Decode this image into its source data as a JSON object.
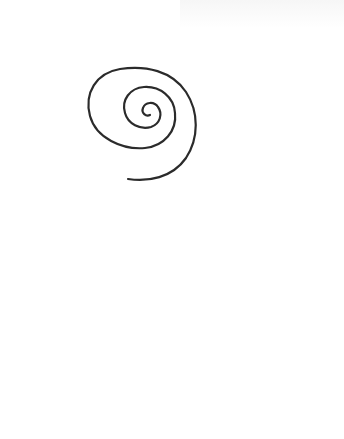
{
  "diagram": {
    "type": "line-drawing",
    "background_color": "#ffffff",
    "stroke_color": "#2b2b2b",
    "figures": [
      {
        "name": "spiral",
        "description": "Outward-opening spiral of roughly three turns, with two small tick marks on its inner windings",
        "tick_marks": 2
      },
      {
        "name": "arc",
        "description": "Open arc rising from lower-left to upper-right then curling downward, with a cross tick at each end",
        "tick_marks": 2
      }
    ]
  }
}
